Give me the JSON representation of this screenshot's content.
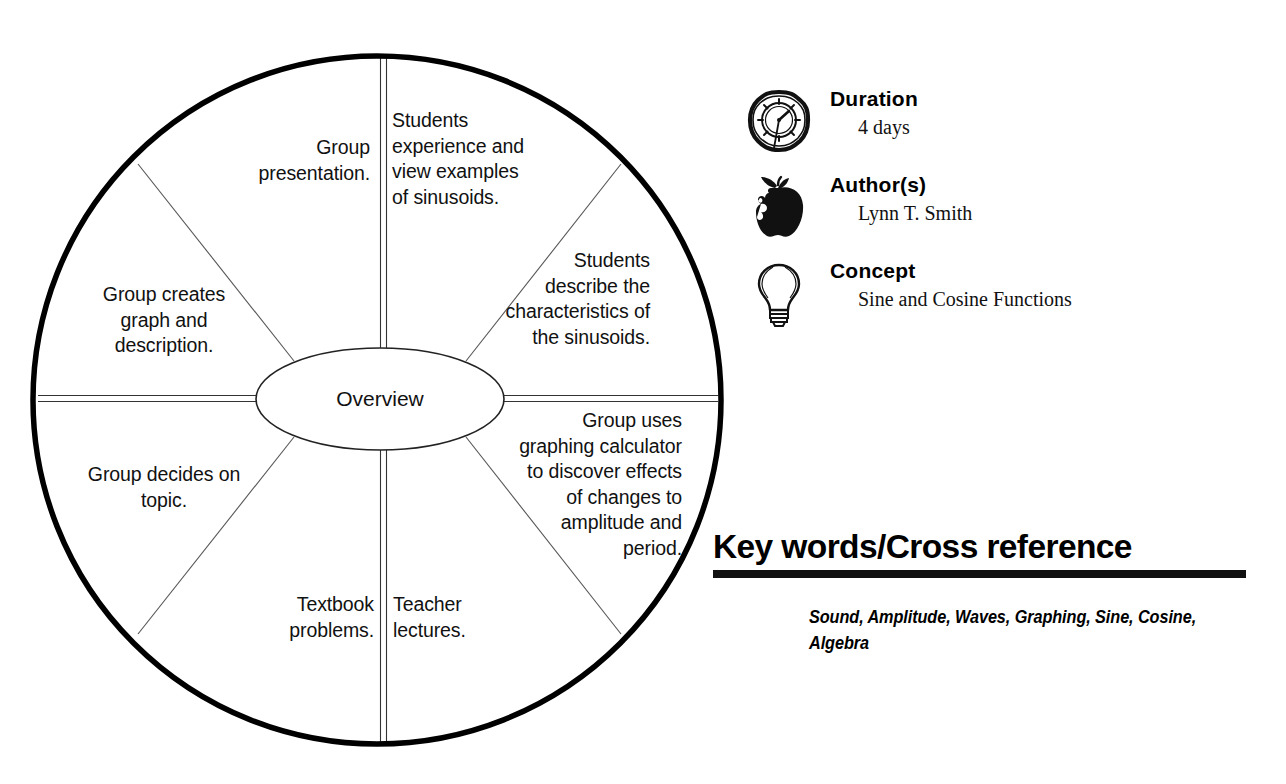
{
  "diagram": {
    "center_label": "Overview",
    "sectors": [
      {
        "id": "students-experience",
        "text": "Students\nexperience and\nview examples\nof sinusoids."
      },
      {
        "id": "students-describe",
        "text": "Students\ndescribe the\ncharacteristics of\nthe sinusoids."
      },
      {
        "id": "group-uses-calculator",
        "text": "Group uses\ngraphing calculator\nto discover effects\nof changes to\namplitude and\nperiod."
      },
      {
        "id": "teacher-lectures",
        "text": "Teacher\nlectures."
      },
      {
        "id": "textbook-problems",
        "text": "Textbook\nproblems."
      },
      {
        "id": "group-decides",
        "text": "Group decides on\ntopic."
      },
      {
        "id": "group-creates-graph",
        "text": "Group creates\ngraph and\ndescription."
      },
      {
        "id": "group-presentation",
        "text": "Group\npresentation."
      }
    ]
  },
  "meta": {
    "rows": [
      {
        "icon": "stopwatch-icon",
        "heading": "Duration",
        "value": "4 days"
      },
      {
        "icon": "apple-icon",
        "heading": "Author(s)",
        "value": "Lynn T. Smith"
      },
      {
        "icon": "lightbulb-icon",
        "heading": "Concept",
        "value": "Sine and Cosine Functions"
      }
    ]
  },
  "keywords": {
    "heading": "Key words/Cross reference",
    "list": "Sound, Amplitude, Waves, Graphing, Sine, Cosine, Algebra"
  },
  "colors": {
    "ink": "#000000",
    "paper": "#ffffff",
    "hairline": "#555555"
  }
}
